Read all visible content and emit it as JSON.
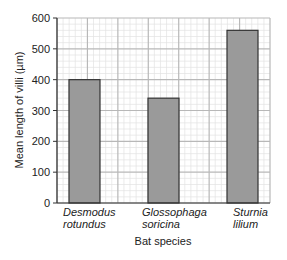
{
  "chart_data": {
    "type": "bar",
    "title": "",
    "xlabel": "Bat species",
    "ylabel": "Mean length of villi (µm)",
    "categories": [
      [
        "Desmodus",
        "rotundus"
      ],
      [
        "Glossophaga",
        "soricina"
      ],
      [
        "Sturnia",
        "lilium"
      ]
    ],
    "category_names": [
      "Desmodus rotundus",
      "Glossophaga soricina",
      "Sturnia lilium"
    ],
    "values": [
      400,
      340,
      560
    ],
    "ylim": [
      0,
      600
    ],
    "yticks": [
      0,
      100,
      200,
      300,
      400,
      500,
      600
    ],
    "grid": true,
    "legend": null
  },
  "colors": {
    "bar_fill": "#9a9a9a",
    "bar_edge": "#333333",
    "grid_major": "#b8b8b8",
    "grid_minor": "#e2e2e2",
    "axis": "#333333"
  }
}
